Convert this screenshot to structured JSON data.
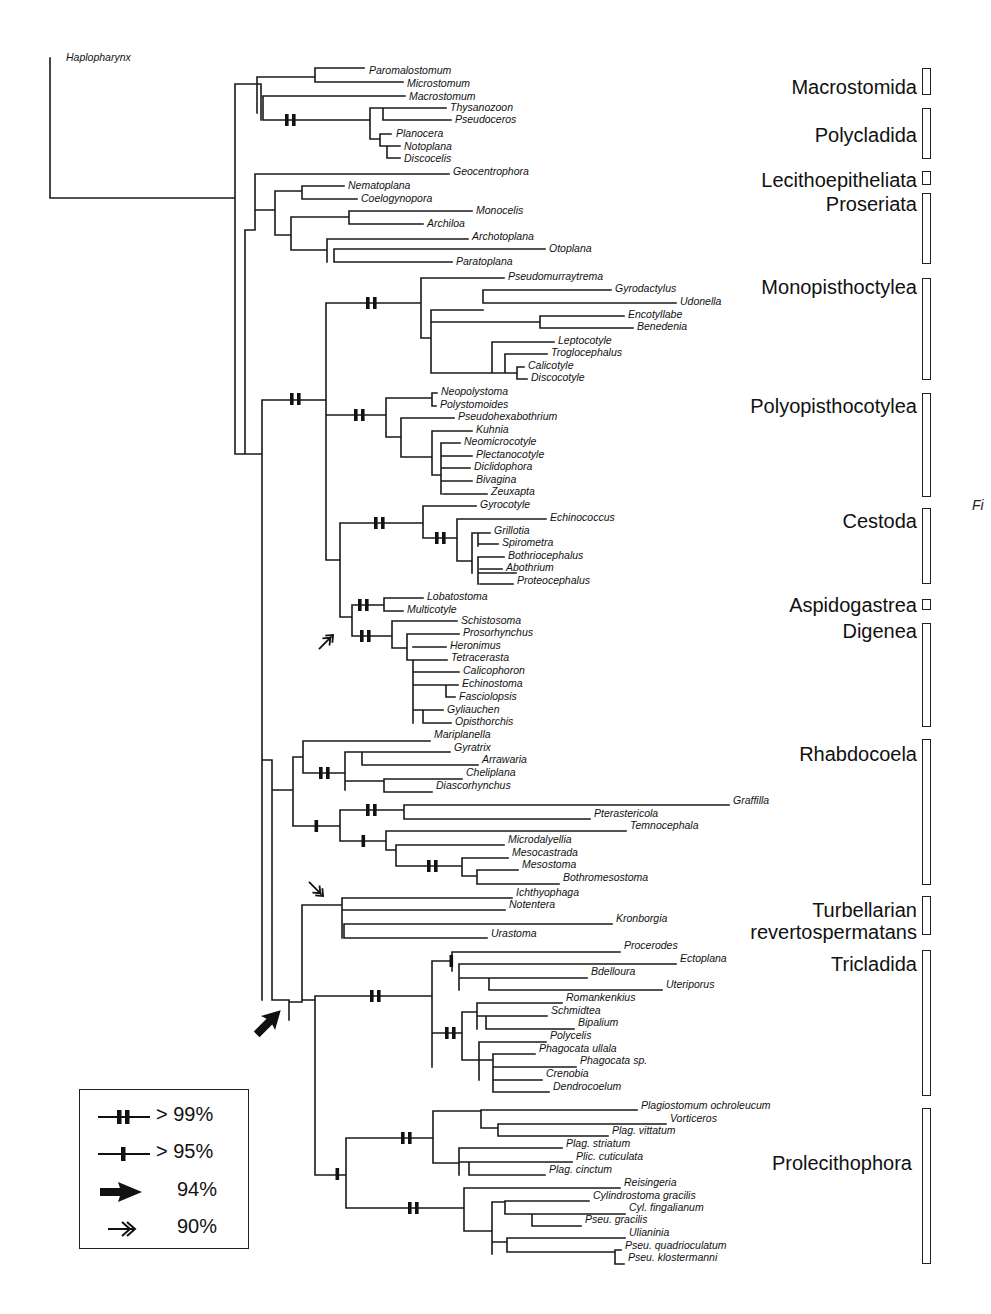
{
  "figure": {
    "type": "phylogenetic-tree",
    "root_taxon": "Haplopharynx",
    "side_tag": "Fi"
  },
  "taxa": [
    {
      "name": "Haplopharynx",
      "x": 66,
      "y": 58
    },
    {
      "name": "Paromalostomum",
      "x": 369,
      "y": 71
    },
    {
      "name": "Microstomum",
      "x": 407,
      "y": 84
    },
    {
      "name": "Macrostomum",
      "x": 409,
      "y": 97
    },
    {
      "name": "Thysanozoon",
      "x": 450,
      "y": 108
    },
    {
      "name": "Pseudoceros",
      "x": 455,
      "y": 120
    },
    {
      "name": "Planocera",
      "x": 396,
      "y": 134
    },
    {
      "name": "Notoplana",
      "x": 404,
      "y": 147
    },
    {
      "name": "Discocelis",
      "x": 404,
      "y": 159
    },
    {
      "name": "Geocentrophora",
      "x": 453,
      "y": 172
    },
    {
      "name": "Nematoplana",
      "x": 348,
      "y": 186
    },
    {
      "name": "Coelogynopora",
      "x": 361,
      "y": 199
    },
    {
      "name": "Monocelis",
      "x": 476,
      "y": 211
    },
    {
      "name": "Archiloa",
      "x": 427,
      "y": 224
    },
    {
      "name": "Archotoplana",
      "x": 472,
      "y": 237
    },
    {
      "name": "Otoplana",
      "x": 549,
      "y": 249
    },
    {
      "name": "Paratoplana",
      "x": 456,
      "y": 262
    },
    {
      "name": "Pseudomurraytrema",
      "x": 508,
      "y": 277
    },
    {
      "name": "Gyrodactylus",
      "x": 615,
      "y": 289
    },
    {
      "name": "Udonella",
      "x": 680,
      "y": 302
    },
    {
      "name": "Encotyllabe",
      "x": 628,
      "y": 315
    },
    {
      "name": "Benedenia",
      "x": 637,
      "y": 327
    },
    {
      "name": "Leptocotyle",
      "x": 558,
      "y": 341
    },
    {
      "name": "Troglocephalus",
      "x": 551,
      "y": 353
    },
    {
      "name": "Calicotyle",
      "x": 528,
      "y": 366
    },
    {
      "name": "Discocotyle",
      "x": 531,
      "y": 378
    },
    {
      "name": "Neopolystoma",
      "x": 441,
      "y": 392
    },
    {
      "name": "Polystomoides",
      "x": 440,
      "y": 405
    },
    {
      "name": "Pseudohexabothrium",
      "x": 458,
      "y": 417
    },
    {
      "name": "Kuhnia",
      "x": 476,
      "y": 430
    },
    {
      "name": "Neomicrocotyle",
      "x": 464,
      "y": 442
    },
    {
      "name": "Plectanocotyle",
      "x": 476,
      "y": 455
    },
    {
      "name": "Diclidophora",
      "x": 474,
      "y": 467
    },
    {
      "name": "Bivagina",
      "x": 476,
      "y": 480
    },
    {
      "name": "Zeuxapta",
      "x": 491,
      "y": 492
    },
    {
      "name": "Gyrocotyle",
      "x": 480,
      "y": 505
    },
    {
      "name": "Echinococcus",
      "x": 550,
      "y": 518
    },
    {
      "name": "Grillotia",
      "x": 494,
      "y": 531
    },
    {
      "name": "Spirometra",
      "x": 502,
      "y": 543
    },
    {
      "name": "Bothriocephalus",
      "x": 508,
      "y": 556
    },
    {
      "name": "Abothrium",
      "x": 506,
      "y": 568
    },
    {
      "name": "Proteocephalus",
      "x": 517,
      "y": 581
    },
    {
      "name": "Lobatostoma",
      "x": 427,
      "y": 597
    },
    {
      "name": "Multicotyle",
      "x": 407,
      "y": 610
    },
    {
      "name": "Schistosoma",
      "x": 461,
      "y": 621
    },
    {
      "name": "Prosorhynchus",
      "x": 463,
      "y": 633
    },
    {
      "name": "Heronimus",
      "x": 450,
      "y": 646
    },
    {
      "name": "Tetracerasta",
      "x": 451,
      "y": 658
    },
    {
      "name": "Calicophoron",
      "x": 463,
      "y": 671
    },
    {
      "name": "Echinostoma",
      "x": 462,
      "y": 684
    },
    {
      "name": "Fasciolopsis",
      "x": 459,
      "y": 697
    },
    {
      "name": "Gyliauchen",
      "x": 447,
      "y": 710
    },
    {
      "name": "Opisthorchis",
      "x": 455,
      "y": 722
    },
    {
      "name": "Mariplanella",
      "x": 434,
      "y": 735
    },
    {
      "name": "Gyratrix",
      "x": 454,
      "y": 748
    },
    {
      "name": "Arrawaria",
      "x": 482,
      "y": 760
    },
    {
      "name": "Cheliplana",
      "x": 466,
      "y": 773
    },
    {
      "name": "Diascorhynchus",
      "x": 436,
      "y": 786
    },
    {
      "name": "Graffilla",
      "x": 733,
      "y": 801
    },
    {
      "name": "Pterastericola",
      "x": 594,
      "y": 814
    },
    {
      "name": "Temnocephala",
      "x": 630,
      "y": 826
    },
    {
      "name": "Microdalyellia",
      "x": 508,
      "y": 840
    },
    {
      "name": "Mesocastrada",
      "x": 512,
      "y": 853
    },
    {
      "name": "Mesostoma",
      "x": 522,
      "y": 865
    },
    {
      "name": "Bothromesostoma",
      "x": 563,
      "y": 878
    },
    {
      "name": "Ichthyophaga",
      "x": 516,
      "y": 893
    },
    {
      "name": "Notentera",
      "x": 509,
      "y": 905
    },
    {
      "name": "Kronborgia",
      "x": 616,
      "y": 919
    },
    {
      "name": "Urastoma",
      "x": 491,
      "y": 934
    },
    {
      "name": "Procerodes",
      "x": 624,
      "y": 946
    },
    {
      "name": "Ectoplana",
      "x": 680,
      "y": 959
    },
    {
      "name": "Bdelloura",
      "x": 591,
      "y": 972
    },
    {
      "name": "Uteriporus",
      "x": 666,
      "y": 985
    },
    {
      "name": "Romankenkius",
      "x": 566,
      "y": 998
    },
    {
      "name": "Schmidtea",
      "x": 551,
      "y": 1011
    },
    {
      "name": "Bipalium",
      "x": 578,
      "y": 1023
    },
    {
      "name": "Polycelis",
      "x": 550,
      "y": 1036
    },
    {
      "name": "Phagocata ullala",
      "x": 539,
      "y": 1049
    },
    {
      "name": "Phagocata sp.",
      "x": 580,
      "y": 1061
    },
    {
      "name": "Crenobia",
      "x": 546,
      "y": 1074
    },
    {
      "name": "Dendrocoelum",
      "x": 553,
      "y": 1087
    },
    {
      "name": "Plagiostomum ochroleucum",
      "x": 641,
      "y": 1106
    },
    {
      "name": "Vorticeros",
      "x": 670,
      "y": 1119
    },
    {
      "name": "Plag. vittatum",
      "x": 612,
      "y": 1131
    },
    {
      "name": "Plag. striatum",
      "x": 566,
      "y": 1144
    },
    {
      "name": "Plic. cuticulata",
      "x": 576,
      "y": 1157
    },
    {
      "name": "Plag. cinctum",
      "x": 549,
      "y": 1170
    },
    {
      "name": "Reisingeria",
      "x": 624,
      "y": 1183
    },
    {
      "name": "Cylindrostoma gracilis",
      "x": 593,
      "y": 1196
    },
    {
      "name": "Cyl. fingalianum",
      "x": 629,
      "y": 1208
    },
    {
      "name": "Pseu. gracilis",
      "x": 585,
      "y": 1220
    },
    {
      "name": "Ulianinia",
      "x": 629,
      "y": 1233
    },
    {
      "name": "Pseu. quadrioculatum",
      "x": 625,
      "y": 1246
    },
    {
      "name": "Pseu. klostermanni",
      "x": 628,
      "y": 1258
    }
  ],
  "clades": [
    {
      "name": "Macrostomida",
      "label_right": 917,
      "label_y": 76,
      "bar_top": 68,
      "bar_bottom": 95
    },
    {
      "name": "Polycladida",
      "label_right": 917,
      "label_y": 124,
      "bar_top": 108,
      "bar_bottom": 159
    },
    {
      "name": "Lecithoepitheliata",
      "label_right": 917,
      "label_y": 169,
      "bar_top": 171,
      "bar_bottom": 185
    },
    {
      "name": "Proseriata",
      "label_right": 917,
      "label_y": 193,
      "bar_top": 193,
      "bar_bottom": 264
    },
    {
      "name": "Monopisthoctylea",
      "label_right": 917,
      "label_y": 276,
      "bar_top": 278,
      "bar_bottom": 380
    },
    {
      "name": "Polyopisthocotylea",
      "label_right": 917,
      "label_y": 395,
      "bar_top": 393,
      "bar_bottom": 497
    },
    {
      "name": "Cestoda",
      "label_right": 917,
      "label_y": 510,
      "bar_top": 508,
      "bar_bottom": 584
    },
    {
      "name": "Aspidogastrea",
      "label_right": 917,
      "label_y": 594,
      "bar_top": 599,
      "bar_bottom": 610
    },
    {
      "name": "Digenea",
      "label_right": 917,
      "label_y": 620,
      "bar_top": 623,
      "bar_bottom": 727
    },
    {
      "name": "Rhabdocoela",
      "label_right": 917,
      "label_y": 743,
      "bar_top": 739,
      "bar_bottom": 885
    },
    {
      "name": "Turbellarian\nrevertospermatans",
      "label_right": 917,
      "label_y": 899,
      "bar_top": 896,
      "bar_bottom": 935
    },
    {
      "name": "Tricladida",
      "label_right": 917,
      "label_y": 953,
      "bar_top": 950,
      "bar_bottom": 1096
    },
    {
      "name": "Prolecithophora",
      "label_right": 912,
      "label_y": 1152,
      "bar_top": 1108,
      "bar_bottom": 1264
    }
  ],
  "legend": {
    "items": [
      {
        "symbol": "double-bar",
        "label": "> 99%"
      },
      {
        "symbol": "single-bar",
        "label": "> 95%"
      },
      {
        "symbol": "solid-arrow",
        "label": "94%"
      },
      {
        "symbol": "open-double-arrow",
        "label": "90%"
      }
    ]
  },
  "support_marks": [
    {
      "type": "double-bar",
      "x": 289,
      "y": 120
    },
    {
      "type": "double-bar",
      "x": 294,
      "y": 399
    },
    {
      "type": "double-bar",
      "x": 370,
      "y": 303
    },
    {
      "type": "double-bar",
      "x": 358,
      "y": 415
    },
    {
      "type": "double-bar",
      "x": 378,
      "y": 523
    },
    {
      "type": "double-bar",
      "x": 439,
      "y": 538
    },
    {
      "type": "double-bar",
      "x": 362,
      "y": 605
    },
    {
      "type": "double-bar",
      "x": 364,
      "y": 636
    },
    {
      "type": "double-bar",
      "x": 323,
      "y": 773
    },
    {
      "type": "single-bar",
      "x": 316,
      "y": 826
    },
    {
      "type": "double-bar",
      "x": 370,
      "y": 810
    },
    {
      "type": "single-bar",
      "x": 363,
      "y": 841
    },
    {
      "type": "double-bar",
      "x": 431,
      "y": 866
    },
    {
      "type": "double-bar",
      "x": 374,
      "y": 996
    },
    {
      "type": "single-bar",
      "x": 451,
      "y": 961
    },
    {
      "type": "double-bar",
      "x": 449,
      "y": 1033
    },
    {
      "type": "double-bar",
      "x": 405,
      "y": 1138
    },
    {
      "type": "single-bar",
      "x": 337,
      "y": 1174
    },
    {
      "type": "double-bar",
      "x": 412,
      "y": 1208
    }
  ],
  "arrows": [
    {
      "type": "open-double-arrow",
      "x": 326,
      "y": 642,
      "rotate": -45
    },
    {
      "type": "open-double-arrow",
      "x": 316,
      "y": 889,
      "rotate": 45
    },
    {
      "type": "solid-arrow",
      "x": 268,
      "y": 1023,
      "rotate": -45
    }
  ],
  "edges": [
    "M50 58 V198 H235",
    "M235 84 V198",
    "M235 84 H261",
    "M261 84 V120",
    "M261 93 H261",
    "M257 77 V113",
    "M257 77 H315",
    "M315 68 V82",
    "M315 68 H364",
    "M315 82 H403",
    "M263 96 H405",
    "M263 96 V120",
    "M263 120 H370",
    "M370 108 V139",
    "M370 108 H446",
    "M383 108 V120",
    "M383 108 H446",
    "M383 120 H451",
    "M370 139 H380",
    "M380 134 V146",
    "M380 134 H391",
    "M380 146 H387",
    "M387 146 V158",
    "M387 146 H400",
    "M387 158 H400",
    "M235 198 V454 H245",
    "M245 230 V454",
    "M245 230 H255",
    "M255 174 V230",
    "M255 174 H449",
    "M255 210 H275",
    "M275 191 V235",
    "M275 191 H302",
    "M302 186 V199",
    "M302 186 H344",
    "M302 199 H357",
    "M275 235 H291",
    "M291 217 V250",
    "M291 217 H349",
    "M349 211 V224",
    "M349 211 H472",
    "M349 224 H423",
    "M291 250 H327",
    "M327 239 V262",
    "M327 239 H468",
    "M334 249 H545",
    "M334 249 V262",
    "M334 262 H452",
    "M245 454 H262",
    "M262 400 V1000",
    "M262 400 H326",
    "M326 303 V560",
    "M326 303 H421",
    "M421 278 V338",
    "M421 278 H504",
    "M421 338 H431",
    "M431 310 V373",
    "M431 310 H483",
    "M483 290 V303",
    "M483 290 H611",
    "M483 303 H676",
    "M431 322 H540",
    "M540 316 V328",
    "M540 316 H624",
    "M540 328 H633",
    "M431 373 H492",
    "M492 342 V373",
    "M492 342 H554",
    "M492 373 H505",
    "M505 354 V373",
    "M505 354 H547",
    "M505 373 H517",
    "M517 367 V379",
    "M517 367 H524",
    "M517 379 H527",
    "M326 415 H386",
    "M386 398 V437",
    "M386 398 H432",
    "M432 393 V406",
    "M432 393 H437",
    "M432 406 H436",
    "M386 437 H401",
    "M401 418 V457",
    "M401 418 H454",
    "M401 457 H432",
    "M432 431 V475",
    "M432 431 H472",
    "M432 475 H441",
    "M441 443 V494",
    "M441 443 H460",
    "M441 456 H472",
    "M441 468 H470",
    "M441 481 H472",
    "M443 494 H487",
    "M326 560 H340",
    "M340 523 V617",
    "M340 523 H423",
    "M423 506 V538",
    "M423 506 H476",
    "M423 538 H457",
    "M457 519 V561",
    "M457 519 H546",
    "M457 561 H472",
    "M472 533 V573",
    "M472 533 H490",
    "M478 544 H498",
    "M478 533 V546",
    "M478 573 H516",
    "M478 557 H504",
    "M478 557 V584",
    "M480 569 H502",
    "M480 584 H513",
    "M340 617 H352",
    "M352 605 V636",
    "M352 605 H384",
    "M384 598 V611",
    "M384 598 H423",
    "M384 611 H403",
    "M352 636 H392",
    "M392 621 V648",
    "M392 621 H457",
    "M392 648 H407",
    "M407 634 V660",
    "M407 634 H459",
    "M413 660 V723",
    "M407 660 H413",
    "M413 647 H446",
    "M413 660 H447",
    "M413 672 H459",
    "M413 685 H446",
    "M446 685 V697",
    "M446 685 H458",
    "M446 697 H455",
    "M413 710 H423",
    "M423 710 V723",
    "M423 710 H443",
    "M423 723 H451",
    "M262 760 H272",
    "M272 760 V900",
    "M272 790 H293",
    "M293 757 V826",
    "M293 757 H303",
    "M303 741 V773",
    "M303 741 H430",
    "M303 773 H345",
    "M345 752 V790",
    "M345 752 H450",
    "M345 752 H345",
    "M362 752 V765",
    "M362 752 H450",
    "M362 765 H478",
    "M345 781 H384",
    "M384 779 V792",
    "M384 779 H462",
    "M384 792 H432",
    "M293 826 H340",
    "M340 810 V841",
    "M340 810 H404",
    "M404 805 V819",
    "M404 805 H729",
    "M404 819 H590",
    "M340 841 H386",
    "M386 831 V850",
    "M386 831 H626",
    "M386 850 H396",
    "M396 845 V866",
    "M396 845 H504",
    "M396 866 H462",
    "M462 858 V876",
    "M462 858 H508",
    "M462 876 H477",
    "M477 870 V884",
    "M477 870 H518",
    "M477 884 H559",
    "M272 1000 H289",
    "M289 1000 V1020",
    "M272 900 V1000",
    "M289 1002 H302",
    "M302 905 V1002",
    "M302 905 H342",
    "M342 898 V938",
    "M342 898 H512",
    "M342 910 H505",
    "M344 924 H612",
    "M344 924 V938",
    "M344 938 H487",
    "M302 1000 H315",
    "M315 996 V1175",
    "M315 996 H432",
    "M432 961 V1067",
    "M432 961 H452",
    "M452 952 V971",
    "M452 952 H620",
    "M459 971 V990",
    "M459 964 H676",
    "M459 964 V990",
    "M459 978 H489",
    "M489 978 V990",
    "M489 978 H587",
    "M489 990 H662",
    "M432 1033 H462",
    "M462 1012 V1060",
    "M462 1012 H477",
    "M477 1003 V1029",
    "M477 1003 H562",
    "M477 1016 H486",
    "M486 1016 V1029",
    "M486 1016 H547",
    "M486 1029 H574",
    "M462 1060 H479",
    "M479 1042 V1080",
    "M479 1042 H546",
    "M479 1060 H493",
    "M493 1054 V1092",
    "M493 1054 H535",
    "M493 1067 H576",
    "M493 1080 H542",
    "M493 1092 H549",
    "M315 1175 H346",
    "M346 1138 V1208",
    "M346 1138 H433",
    "M433 1111 V1163",
    "M433 1111 H481",
    "M481 1110 V1128",
    "M481 1110 H637",
    "M481 1128 H498",
    "M498 1124 V1136",
    "M498 1124 H666",
    "M498 1136 H608",
    "M433 1163 H459",
    "M459 1148 V1175",
    "M459 1148 H562",
    "M459 1162 H469",
    "M469 1162 V1175",
    "M469 1162 H572",
    "M469 1175 H545",
    "M346 1208 H464",
    "M464 1188 V1231",
    "M464 1188 H620",
    "M464 1231 H492",
    "M492 1202 V1254",
    "M492 1202 H505",
    "M505 1201 V1214",
    "M505 1201 H589",
    "M505 1214 H532",
    "M532 1214 V1226",
    "M532 1214 H625",
    "M532 1226 H581",
    "M492 1242 H507",
    "M507 1238 V1252",
    "M507 1238 H625",
    "M507 1252 H615",
    "M615 1250 V1264",
    "M615 1250 H621",
    "M615 1264 H624"
  ]
}
